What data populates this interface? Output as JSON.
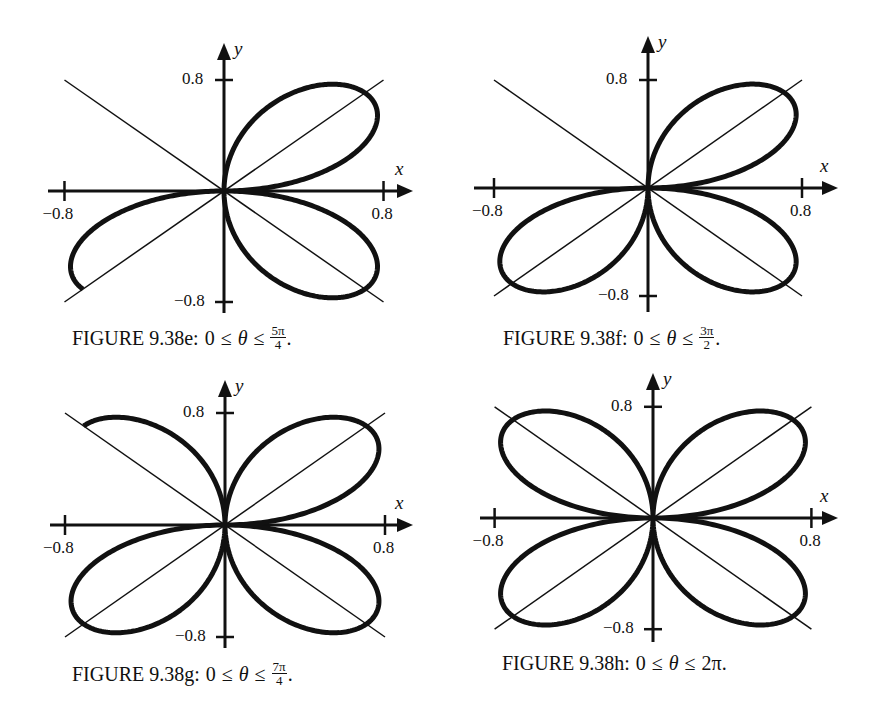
{
  "chart_data": [
    {
      "type": "line",
      "id": "e",
      "title": "FIGURE 9.38e",
      "caption": {
        "label": "FIGURE 9.38e:",
        "lhs": "0",
        "rel1": "≤",
        "var": "θ",
        "rel2": "≤",
        "upper_num": "5π",
        "upper_den": "4",
        "upper_plain": "",
        "end": "."
      },
      "equation": "r = sin(2θ)",
      "theta_range": [
        0,
        3.9269908
      ],
      "theta_range_label": "0 ≤ θ ≤ 5π/4",
      "xlabel": "x",
      "ylabel": "y",
      "xlim": [
        -0.8,
        0.8
      ],
      "ylim": [
        -0.8,
        0.8
      ],
      "x_ticks": [
        "-0.8",
        "0.8"
      ],
      "y_ticks": [
        "0.8",
        "-0.8"
      ],
      "tick_labels": {
        "x_neg": "−0.8",
        "x_pos": "0.8",
        "y_pos": "0.8",
        "y_neg": "−0.8"
      },
      "reference_lines": [
        "y = x",
        "y = -x"
      ],
      "frame": {
        "ox": 224,
        "oy": 191,
        "px_per_unit_x": 199.4,
        "px_per_unit_y": 138.75,
        "x_axis_start": 48,
        "x_arrow_tip": 413,
        "y_arrow_tip": 43,
        "y_axis_end": 313
      },
      "caption_pos": {
        "left": 72,
        "top": 324
      }
    },
    {
      "type": "line",
      "id": "f",
      "title": "FIGURE 9.38f",
      "caption": {
        "label": "FIGURE 9.38f:",
        "lhs": "0",
        "rel1": "≤",
        "var": "θ",
        "rel2": "≤",
        "upper_num": "3π",
        "upper_den": "2",
        "upper_plain": "",
        "end": "."
      },
      "equation": "r = sin(2θ)",
      "theta_range": [
        0,
        4.712389
      ],
      "theta_range_label": "0 ≤ θ ≤ 3π/2",
      "xlabel": "x",
      "ylabel": "y",
      "xlim": [
        -0.8,
        0.8
      ],
      "ylim": [
        -0.8,
        0.8
      ],
      "x_ticks": [
        "-0.8",
        "0.8"
      ],
      "y_ticks": [
        "0.8",
        "-0.8"
      ],
      "tick_labels": {
        "x_neg": "−0.8",
        "x_pos": "0.8",
        "y_pos": "0.8",
        "y_neg": "−0.8"
      },
      "reference_lines": [
        "y = x",
        "y = -x"
      ],
      "frame": {
        "ox": 648,
        "oy": 188,
        "px_per_unit_x": 192.5,
        "px_per_unit_y": 135,
        "x_axis_start": 474,
        "x_arrow_tip": 838,
        "y_arrow_tip": 36,
        "y_axis_end": 312
      },
      "caption_pos": {
        "left": 503,
        "top": 324
      }
    },
    {
      "type": "line",
      "id": "g",
      "title": "FIGURE 9.38g",
      "caption": {
        "label": "FIGURE 9.38g:",
        "lhs": "0",
        "rel1": "≤",
        "var": "θ",
        "rel2": "≤",
        "upper_num": "7π",
        "upper_den": "4",
        "upper_plain": "",
        "end": "."
      },
      "equation": "r = sin(2θ)",
      "theta_range": [
        0,
        5.497787
      ],
      "theta_range_label": "0 ≤ θ ≤ 7π/4",
      "xlabel": "x",
      "ylabel": "y",
      "xlim": [
        -0.8,
        0.8
      ],
      "ylim": [
        -0.8,
        0.8
      ],
      "x_ticks": [
        "-0.8",
        "0.8"
      ],
      "y_ticks": [
        "0.8",
        "-0.8"
      ],
      "tick_labels": {
        "x_neg": "−0.8",
        "x_pos": "0.8",
        "y_pos": "0.8",
        "y_neg": "−0.8"
      },
      "reference_lines": [
        "y = x",
        "y = -x"
      ],
      "frame": {
        "ox": 225,
        "oy": 525,
        "px_per_unit_x": 200,
        "px_per_unit_y": 140,
        "x_axis_start": 50,
        "x_arrow_tip": 413,
        "y_arrow_tip": 380,
        "y_axis_end": 648
      },
      "caption_pos": {
        "left": 72,
        "top": 660
      }
    },
    {
      "type": "line",
      "id": "h",
      "title": "FIGURE 9.38h",
      "caption": {
        "label": "FIGURE 9.38h:",
        "lhs": "0",
        "rel1": "≤",
        "var": "θ",
        "rel2": "≤",
        "upper_num": "",
        "upper_den": "",
        "upper_plain": "2π",
        "end": "."
      },
      "equation": "r = sin(2θ)",
      "theta_range": [
        0,
        6.2831853
      ],
      "theta_range_label": "0 ≤ θ ≤ 2π",
      "xlabel": "x",
      "ylabel": "y",
      "xlim": [
        -0.8,
        0.8
      ],
      "ylim": [
        -0.8,
        0.8
      ],
      "x_ticks": [
        "-0.8",
        "0.8"
      ],
      "y_ticks": [
        "0.8",
        "-0.8"
      ],
      "tick_labels": {
        "x_neg": "−0.8",
        "x_pos": "0.8",
        "y_pos": "0.8",
        "y_neg": "−0.8"
      },
      "reference_lines": [
        "y = x",
        "y = -x"
      ],
      "frame": {
        "ox": 653,
        "oy": 518,
        "px_per_unit_x": 198,
        "px_per_unit_y": 139,
        "x_axis_start": 480,
        "x_arrow_tip": 838,
        "y_arrow_tip": 373,
        "y_axis_end": 642
      },
      "caption_pos": {
        "left": 502,
        "top": 652
      }
    }
  ]
}
